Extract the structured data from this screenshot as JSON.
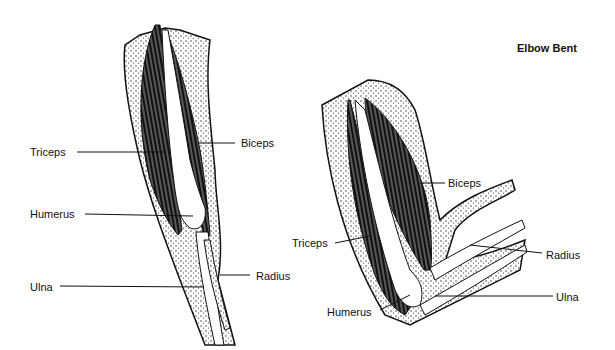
{
  "title": "Elbow Bent",
  "left_arm": {
    "labels": {
      "triceps": "Triceps",
      "biceps": "Biceps",
      "humerus": "Humerus",
      "radius": "Radius",
      "ulna": "Ulna"
    }
  },
  "right_arm": {
    "labels": {
      "triceps": "Triceps",
      "biceps": "Biceps",
      "humerus": "Humerus",
      "radius": "Radius",
      "ulna": "Ulna"
    }
  },
  "colors": {
    "ink": "#111111",
    "background": "#ffffff"
  }
}
